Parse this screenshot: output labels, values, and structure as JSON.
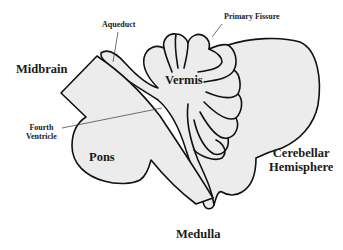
{
  "diagram": {
    "fill_color": "#ececec",
    "stroke_color": "#111111",
    "labels": {
      "aqueduct": "Aqueduct",
      "primary_fissure": "Primary Fissure",
      "midbrain": "Midbrain",
      "vermis": "Vermis",
      "fourth_ventricle_line1": "Fourth",
      "fourth_ventricle_line2": "Ventricle",
      "pons": "Pons",
      "cerebellar_hemisphere_line1": "Cerebellar",
      "cerebellar_hemisphere_line2": "Hemisphere",
      "medulla": "Medulla"
    }
  }
}
